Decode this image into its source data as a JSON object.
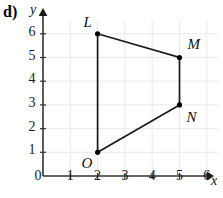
{
  "figure": {
    "part_label": "d)",
    "x_axis_name": "x",
    "y_axis_name": "y",
    "origin_label": "0"
  },
  "chart_data": {
    "type": "scatter",
    "title": "",
    "subtitle": "",
    "xlabel": "x",
    "ylabel": "y",
    "xlim": [
      0,
      6.6
    ],
    "ylim": [
      0,
      6.6
    ],
    "grid": true,
    "legend": "none",
    "x_ticks": [
      "1",
      "2",
      "3",
      "4",
      "5",
      "6"
    ],
    "y_ticks": [
      "1",
      "2",
      "3",
      "4",
      "5",
      "6"
    ],
    "x_tick_values": [
      1,
      2,
      3,
      4,
      5,
      6
    ],
    "y_tick_values": [
      1,
      2,
      3,
      4,
      5,
      6
    ],
    "points": [
      {
        "name": "L",
        "x": 2,
        "y": 6,
        "label_dx": -14,
        "label_dy": -20
      },
      {
        "name": "M",
        "x": 5,
        "y": 5,
        "label_dx": 8,
        "label_dy": -22
      },
      {
        "name": "N",
        "x": 5,
        "y": 3,
        "label_dx": 7,
        "label_dy": 4
      },
      {
        "name": "O",
        "x": 2,
        "y": 1,
        "label_dx": -16,
        "label_dy": 3
      }
    ],
    "polygon_order": [
      "L",
      "M",
      "N",
      "O"
    ],
    "closed": true,
    "annotations": [
      "Quadrilateral LMNO plotted on a coordinate grid"
    ],
    "colors": {
      "stroke": "#1a1a1a",
      "marker": "#000000",
      "grid": "#e9e9ed",
      "axis": "#333333"
    }
  }
}
